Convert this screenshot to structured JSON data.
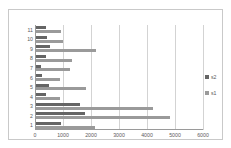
{
  "chart_data": {
    "type": "bar",
    "orientation": "horizontal",
    "title": "",
    "xlabel": "",
    "ylabel": "",
    "categories": [
      "1",
      "2",
      "3",
      "4",
      "5",
      "6",
      "7",
      "8",
      "9",
      "10",
      "11"
    ],
    "series": [
      {
        "name": "s1",
        "color": "#9a9a9a",
        "values": [
          2110,
          4790,
          4180,
          870,
          1780,
          870,
          1210,
          1280,
          2140,
          970,
          890
        ]
      },
      {
        "name": "s2",
        "color": "#656565",
        "values": [
          890,
          1750,
          1570,
          350,
          460,
          200,
          180,
          360,
          500,
          390,
          360
        ]
      }
    ],
    "xlim": [
      0,
      6000
    ],
    "xticks": [
      0,
      1000,
      2000,
      3000,
      4000,
      5000,
      6000
    ],
    "xtick_labels": [
      "0",
      "1000",
      "2000",
      "3000",
      "4000",
      "5000",
      "6000"
    ],
    "grid": true,
    "grid_axis": "x",
    "legend_position": "right",
    "legend": [
      "s2",
      "s1"
    ],
    "plot_background": "#ffffff",
    "border_color": "#c9c9c9"
  }
}
